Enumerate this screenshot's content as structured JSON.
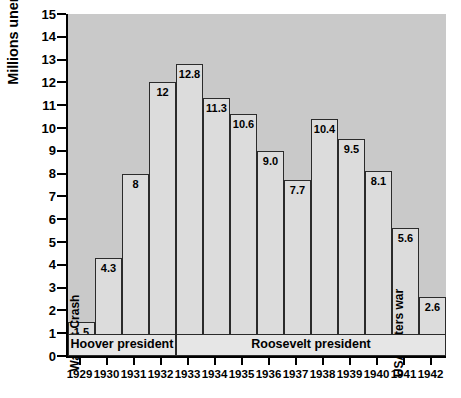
{
  "chart_data": {
    "type": "bar",
    "title": "",
    "xlabel": "",
    "ylabel": "Millions unemployed",
    "ylim": [
      0,
      15
    ],
    "ytick_labels": [
      "15",
      "14",
      "13",
      "12",
      "11",
      "10",
      "9",
      "8",
      "7",
      "6",
      "5",
      "4",
      "3",
      "2",
      "1",
      "0"
    ],
    "grid": false,
    "legend": "none",
    "categories": [
      "1929",
      "1930",
      "1931",
      "1932",
      "1933",
      "1934",
      "1935",
      "1936",
      "1937",
      "1938",
      "1939",
      "1940",
      "1941",
      "1942"
    ],
    "values": [
      1.5,
      4.3,
      8,
      12,
      12.8,
      11.3,
      10.6,
      9.0,
      7.7,
      10.4,
      9.5,
      8.1,
      5.6,
      2.6
    ],
    "value_labels": [
      "1.5",
      "4.3",
      "8",
      "12",
      "12.8",
      "11.3",
      "10.6",
      "9.0",
      "7.7",
      "10.4",
      "9.5",
      "8.1",
      "5.6",
      "2.6"
    ],
    "annotations": [
      {
        "category": "1929",
        "text": "Wall St Crash"
      },
      {
        "category": "1941",
        "text": "USA enters war"
      }
    ],
    "bands": [
      {
        "label": "Hoover president",
        "start_category": "1929",
        "end_category": "1932"
      },
      {
        "label": "Roosevelt president",
        "start_category": "1933",
        "end_category": "1942"
      }
    ]
  },
  "colors": {
    "plot_background": "#c9c9c9",
    "bar_fill": "#dcdcdc",
    "bar_border": "#2b2b2b",
    "band_fill": "#e6e6e6",
    "axis": "#000000",
    "page_background": "#ffffff"
  }
}
